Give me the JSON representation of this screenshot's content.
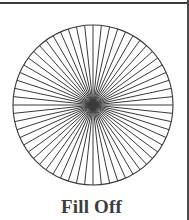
{
  "figure": {
    "caption": "Fill Off",
    "title": "Fill Off",
    "kind": "radial-spoke-circle",
    "center_x": 93,
    "center_y": 99,
    "radius": 80,
    "spoke_count": 60,
    "spoke_angle_step_degrees": 6,
    "stroke_color": "#3a3a3a",
    "stroke_width": 1,
    "fill": "none",
    "background_color": "#ffffff"
  },
  "rules": {
    "top_rule_label": "top-border-rule",
    "right_rule_label": "right-border-rule",
    "rule_color": "#3a3a3a"
  }
}
